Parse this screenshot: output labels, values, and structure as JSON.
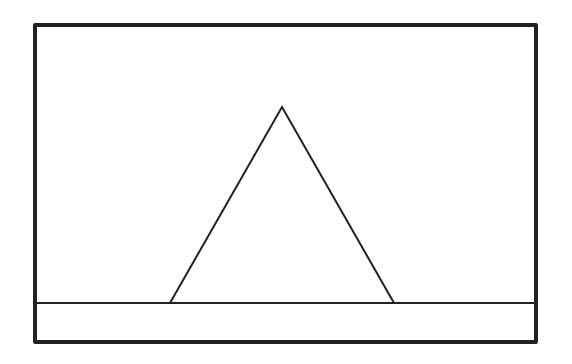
{
  "figure": {
    "width": 572,
    "height": 364,
    "stroke_color": "#222222",
    "background": "#ffffff",
    "frame": {
      "x": 35,
      "y": 25,
      "width": 501,
      "height": 317,
      "stroke_width": 4
    },
    "ground_line": {
      "x1": 37,
      "y1": 303,
      "x2": 535,
      "y2": 303,
      "stroke_width": 2
    },
    "triangle": {
      "apex": [
        282,
        107
      ],
      "base_left": [
        170,
        303
      ],
      "base_right": [
        394,
        303
      ],
      "stroke_width": 2
    }
  }
}
